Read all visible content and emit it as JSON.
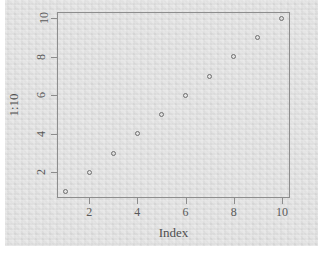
{
  "chart_data": {
    "type": "scatter",
    "title": "",
    "xlabel": "Index",
    "ylabel": "1:10",
    "x": [
      1,
      2,
      3,
      4,
      5,
      6,
      7,
      8,
      9,
      10
    ],
    "y": [
      1,
      2,
      3,
      4,
      5,
      6,
      7,
      8,
      9,
      10
    ],
    "xlim": [
      0.665,
      10.335
    ],
    "ylim": [
      0.665,
      10.335
    ],
    "xticks": [
      2,
      4,
      6,
      8,
      10
    ],
    "yticks": [
      2,
      4,
      6,
      8,
      10
    ],
    "xtick_labels": [
      "2",
      "4",
      "6",
      "8",
      "10"
    ],
    "ytick_labels": [
      "2",
      "4",
      "6",
      "8",
      "10"
    ],
    "grid": false,
    "legend": null,
    "marker": "open-circle",
    "series": [
      {
        "name": "1:10",
        "points": [
          {
            "x": 1,
            "y": 1
          },
          {
            "x": 2,
            "y": 2
          },
          {
            "x": 3,
            "y": 3
          },
          {
            "x": 4,
            "y": 4
          },
          {
            "x": 5,
            "y": 5
          },
          {
            "x": 6,
            "y": 6
          },
          {
            "x": 7,
            "y": 7
          },
          {
            "x": 8,
            "y": 8
          },
          {
            "x": 9,
            "y": 9
          },
          {
            "x": 10,
            "y": 10
          }
        ]
      }
    ]
  },
  "style": {
    "background": "#dddddd",
    "frame_color": "#8d8d8d",
    "point_color": "#6f6f6f",
    "text_color": "#4f4f4f"
  }
}
